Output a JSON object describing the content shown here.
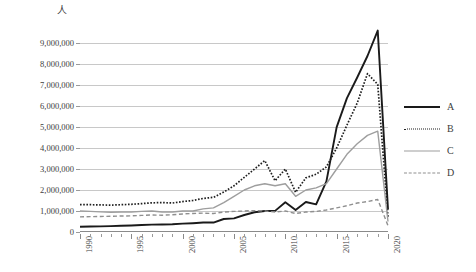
{
  "chart_data": {
    "type": "line",
    "title": "",
    "subtitle": "",
    "xlabel": "",
    "ylabel": "",
    "unit_label": "人",
    "grid": "horizontal",
    "legend_position": "right",
    "xlim": [
      1990,
      2020
    ],
    "ylim": [
      0,
      9000000
    ],
    "ytick_values": [
      0,
      1000000,
      2000000,
      3000000,
      4000000,
      5000000,
      6000000,
      7000000,
      8000000,
      9000000
    ],
    "ytick_labels": [
      "0",
      "1,000,000",
      "2,000,000",
      "3,000,000",
      "4,000,000",
      "5,000,000",
      "6,000,000",
      "7,000,000",
      "8,000,000",
      "9,000,000"
    ],
    "xtick_major_labels": [
      "1990",
      "1995",
      "2000",
      "2005",
      "2010",
      "2015",
      "2020"
    ],
    "xtick_major_values": [
      1990,
      1995,
      2000,
      2005,
      2010,
      2015,
      2020
    ],
    "x": [
      1990,
      1991,
      1992,
      1993,
      1994,
      1995,
      1996,
      1997,
      1998,
      1999,
      2000,
      2001,
      2002,
      2003,
      2004,
      2005,
      2006,
      2007,
      2008,
      2009,
      2010,
      2011,
      2012,
      2013,
      2014,
      2015,
      2016,
      2017,
      2018,
      2019,
      2020
    ],
    "series": [
      {
        "name": "A",
        "style": "solid-thick",
        "color": "#1a1a1a",
        "values": [
          250000,
          260000,
          270000,
          280000,
          300000,
          310000,
          330000,
          350000,
          360000,
          370000,
          400000,
          420000,
          450000,
          450000,
          620000,
          650000,
          810000,
          940000,
          1000000,
          1006000,
          1413000,
          1043000,
          1430000,
          1314000,
          2409000,
          4994000,
          6373000,
          7356000,
          8380000,
          9594000,
          1069000
        ]
      },
      {
        "name": "B",
        "style": "dotted",
        "color": "#1f1f1f",
        "values": [
          1300000,
          1300000,
          1290000,
          1280000,
          1300000,
          1320000,
          1350000,
          1390000,
          1400000,
          1380000,
          1450000,
          1500000,
          1600000,
          1650000,
          1900000,
          2200000,
          2600000,
          3000000,
          3400000,
          2440000,
          3000000,
          1890000,
          2580000,
          2750000,
          3100000,
          4000000,
          5090000,
          6140000,
          7540000,
          7030000,
          690000
        ]
      },
      {
        "name": "C",
        "style": "solid-gray",
        "color": "#9e9e9e",
        "values": [
          1000000,
          980000,
          960000,
          940000,
          950000,
          950000,
          980000,
          1000000,
          950000,
          950000,
          1000000,
          1000000,
          1100000,
          1150000,
          1400000,
          1700000,
          2000000,
          2200000,
          2300000,
          2200000,
          2300000,
          1700000,
          2000000,
          2100000,
          2300000,
          3000000,
          3700000,
          4200000,
          4600000,
          4800000,
          500000
        ]
      },
      {
        "name": "D",
        "style": "dashed",
        "color": "#8f8f8f",
        "values": [
          720000,
          730000,
          740000,
          750000,
          760000,
          770000,
          790000,
          810000,
          800000,
          820000,
          860000,
          880000,
          900000,
          880000,
          950000,
          980000,
          1000000,
          1020000,
          1000000,
          950000,
          1000000,
          880000,
          950000,
          980000,
          1050000,
          1150000,
          1250000,
          1380000,
          1450000,
          1550000,
          300000
        ]
      }
    ]
  },
  "legend": {
    "entries": [
      {
        "label": "A"
      },
      {
        "label": "B"
      },
      {
        "label": "C"
      },
      {
        "label": "D"
      }
    ]
  }
}
